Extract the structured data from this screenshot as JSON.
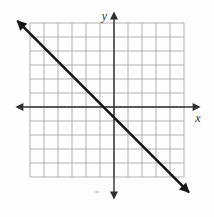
{
  "figure": {
    "kind": "coordinate-plane-graph",
    "background": "#fefefe"
  },
  "chart_data": {
    "type": "line",
    "title": "",
    "grid": {
      "columns": 11,
      "rows": 11,
      "cell_px": 14,
      "x_range": [
        -6,
        5
      ],
      "y_range": [
        -5,
        6
      ],
      "grid_on": true,
      "tick_labels": []
    },
    "axes": {
      "x_label": "x",
      "y_label": "y",
      "arrows_both_ends": true,
      "origin_col": 6,
      "origin_row": 6
    },
    "series": [
      {
        "name": "graphed-line",
        "slope": -1,
        "x_intercept": -0.75,
        "y_intercept": -0.75,
        "endpoints_grid_units": [
          [
            -6.85,
            6.1
          ],
          [
            5.3,
            -6.05
          ]
        ],
        "arrowheads": "both"
      }
    ],
    "colors": {
      "grid": "#b3b1af",
      "axis": "#2f2f2f",
      "line": "#161616",
      "label": "#2f2f2f",
      "background": "#fefefe"
    },
    "legend": "none"
  }
}
